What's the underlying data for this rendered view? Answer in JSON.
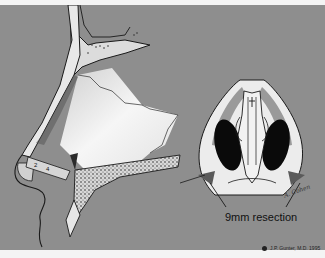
{
  "figure": {
    "type": "medical-illustration",
    "left_view": "lateral sagittal view of nose showing septum and nasal bones",
    "right_view": "basal (inferior) view of nose showing nostrils and columella",
    "resection_label": "9mm resection",
    "copyright": "J.P. Gunter, M.D. 1995",
    "signature": "A. Cohen",
    "colors": {
      "background": "#8e8e8e",
      "cartilage": "#e8e8e8",
      "bone": "#d9d9d9",
      "outline": "#1a1a1a",
      "nostril": "#0a0a0a",
      "resection_wedge": "#5a5a5a"
    }
  }
}
